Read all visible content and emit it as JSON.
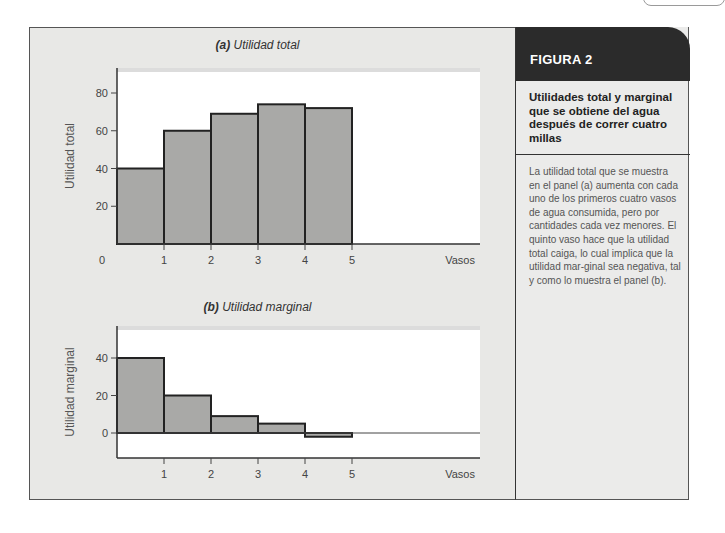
{
  "figure": {
    "label": "FIGURA 2",
    "title": "Utilidades total y marginal que se obtiene del agua después de correr cuatro millas",
    "caption": "La utilidad total que se muestra en el panel (a) aumenta con cada uno de los primeros cuatro vasos de agua consumida, pero por cantidades cada vez menores. El quinto vaso hace que la utilidad total caiga, lo cual implica que la utilidad mar-ginal sea negativa, tal y como lo muestra el panel (b)."
  },
  "panels": {
    "a": {
      "letter": "(a)",
      "title": "Utilidad total"
    },
    "b": {
      "letter": "(b)",
      "title": "Utilidad marginal"
    }
  },
  "chart_data": [
    {
      "type": "bar",
      "title": "(a) Utilidad total",
      "xlabel": "Vasos",
      "ylabel": "Utilidad total",
      "categories": [
        "1",
        "2",
        "3",
        "4",
        "5"
      ],
      "x_ticks": [
        "0",
        "1",
        "2",
        "3",
        "4",
        "5"
      ],
      "values": [
        40,
        60,
        69,
        74,
        72
      ],
      "y_ticks": [
        20,
        40,
        60,
        80
      ],
      "ylim": [
        0,
        92
      ],
      "grid": false,
      "bar_color": "#a9a9a7"
    },
    {
      "type": "bar",
      "title": "(b) Utilidad marginal",
      "xlabel": "Vasos",
      "ylabel": "Utilidad marginal",
      "categories": [
        "1",
        "2",
        "3",
        "4",
        "5"
      ],
      "x_ticks": [
        "1",
        "2",
        "3",
        "4",
        "5"
      ],
      "values": [
        40,
        20,
        9,
        5,
        -2
      ],
      "y_ticks": [
        0,
        20,
        40
      ],
      "ylim": [
        -13,
        56
      ],
      "grid": false,
      "bar_color": "#a9a9a7"
    }
  ]
}
